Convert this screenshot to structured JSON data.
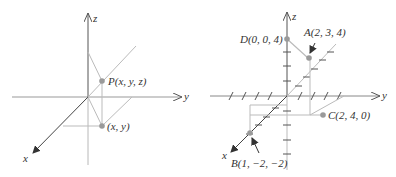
{
  "colors": {
    "axis": "#555555",
    "axis_light": "#b8b8b8",
    "guide": "#bdbdbd",
    "point": "#9a9a9a",
    "text": "#333333",
    "background": "#ffffff"
  },
  "left_diagram": {
    "axes": {
      "x": "x",
      "y": "y",
      "z": "z"
    },
    "points": [
      {
        "id": "P",
        "label": "P(x, y, z)"
      },
      {
        "id": "xy",
        "label": "(x, y)"
      }
    ]
  },
  "right_diagram": {
    "axes": {
      "x": "x",
      "y": "y",
      "z": "z"
    },
    "points": [
      {
        "id": "A",
        "label": "A(2, 3, 4)",
        "coords": [
          2,
          3,
          4
        ]
      },
      {
        "id": "B",
        "label": "B(1, −2, −2)",
        "coords": [
          1,
          -2,
          -2
        ]
      },
      {
        "id": "C",
        "label": "C(2, 4, 0)",
        "coords": [
          2,
          4,
          0
        ]
      },
      {
        "id": "D",
        "label": "D(0, 0, 4)",
        "coords": [
          0,
          0,
          4
        ]
      }
    ]
  }
}
